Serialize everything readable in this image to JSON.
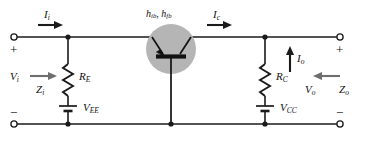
{
  "figure": {
    "type": "circuit-schematic",
    "name": "common-base-transistor-amplifier",
    "background_color": "#ffffff",
    "wire_color": "#1a1a1a",
    "device_fill_color": "#b5b5b5"
  },
  "labels": {
    "input_current": "I",
    "input_current_sub": "i",
    "collector_current": "I",
    "collector_current_sub": "c",
    "output_current": "I",
    "output_current_sub": "o",
    "input_voltage": "V",
    "input_voltage_sub": "i",
    "output_voltage": "V",
    "output_voltage_sub": "o",
    "input_impedance": "Z",
    "input_impedance_sub": "i",
    "output_impedance": "Z",
    "output_impedance_sub": "o",
    "emitter_resistor": "R",
    "emitter_resistor_sub": "E",
    "collector_resistor": "R",
    "collector_resistor_sub": "C",
    "emitter_supply": "V",
    "emitter_supply_sub": "EE",
    "collector_supply": "V",
    "collector_supply_sub": "CC",
    "h_param_ib": "h",
    "h_param_ib_sub": "ib",
    "h_param_fb": "h",
    "h_param_fb_sub": "fb",
    "h_param_separator": ",",
    "plus_input": "+",
    "minus_input": "−",
    "plus_output": "+",
    "minus_output": "−"
  },
  "terminals": [
    {
      "name": "input-positive",
      "polarity": "+"
    },
    {
      "name": "input-negative",
      "polarity": "−"
    },
    {
      "name": "output-positive",
      "polarity": "+"
    },
    {
      "name": "output-negative",
      "polarity": "−"
    }
  ],
  "components": [
    {
      "name": "emitter-resistor",
      "label": "R_E",
      "kind": "resistor"
    },
    {
      "name": "collector-resistor",
      "label": "R_C",
      "kind": "resistor"
    },
    {
      "name": "emitter-supply-battery",
      "label": "V_EE",
      "kind": "battery"
    },
    {
      "name": "collector-supply-battery",
      "label": "V_CC",
      "kind": "battery"
    },
    {
      "name": "transistor",
      "label": "h_ib, h_fb",
      "kind": "pnp-bjt-common-base"
    }
  ]
}
